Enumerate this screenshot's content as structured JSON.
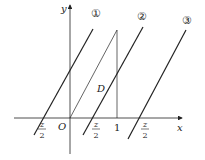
{
  "diagram": {
    "axes": {
      "x_label": "x",
      "y_label": "y",
      "origin_label": "O"
    },
    "tick_labels": {
      "one": "1"
    },
    "region_label": "D",
    "lines": [
      {
        "id": "1",
        "label": "①",
        "intercept_num": "z",
        "intercept_den": "2"
      },
      {
        "id": "2",
        "label": "②",
        "intercept_num": "z",
        "intercept_den": "2"
      },
      {
        "id": "3",
        "label": "③",
        "intercept_num": "z",
        "intercept_den": "2"
      }
    ],
    "colors": {
      "stroke": "#222222"
    }
  }
}
